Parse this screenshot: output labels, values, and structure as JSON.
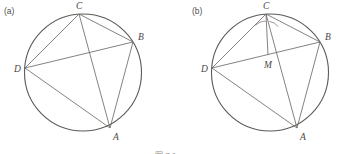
{
  "figure": {
    "caption": "图 7.1",
    "panels": [
      {
        "id": "a",
        "label": "(a)",
        "circle": {
          "cx": 83,
          "cy": 72.5,
          "r": 58.5
        },
        "points": [
          {
            "name": "A",
            "label": "A",
            "x": 110,
            "y": 128,
            "lx": 113,
            "ly": 140
          },
          {
            "name": "B",
            "label": "B",
            "x": 133,
            "y": 42,
            "lx": 138,
            "ly": 40
          },
          {
            "name": "C",
            "label": "C",
            "x": 79,
            "y": 14,
            "lx": 76,
            "ly": 9
          },
          {
            "name": "D",
            "label": "D",
            "x": 25,
            "y": 68,
            "lx": 14,
            "ly": 72
          }
        ],
        "segments": [
          {
            "from": "D",
            "to": "C"
          },
          {
            "from": "C",
            "to": "B"
          },
          {
            "from": "B",
            "to": "A"
          },
          {
            "from": "A",
            "to": "D"
          },
          {
            "from": "D",
            "to": "B"
          },
          {
            "from": "C",
            "to": "A"
          }
        ]
      },
      {
        "id": "b",
        "label": "(b)",
        "circle": {
          "cx": 270,
          "cy": 72.5,
          "r": 58.5
        },
        "points": [
          {
            "name": "A",
            "label": "A",
            "x": 297,
            "y": 128,
            "lx": 300,
            "ly": 140
          },
          {
            "name": "B",
            "label": "B",
            "x": 320,
            "y": 42,
            "lx": 325,
            "ly": 40
          },
          {
            "name": "C",
            "label": "C",
            "x": 266,
            "y": 14,
            "lx": 263,
            "ly": 9
          },
          {
            "name": "D",
            "label": "D",
            "x": 212,
            "y": 68,
            "lx": 201,
            "ly": 72
          },
          {
            "name": "M",
            "label": "M",
            "x": 268,
            "y": 55,
            "lx": 265,
            "ly": 68
          }
        ],
        "segments": [
          {
            "from": "D",
            "to": "C"
          },
          {
            "from": "C",
            "to": "B"
          },
          {
            "from": "B",
            "to": "A"
          },
          {
            "from": "A",
            "to": "D"
          },
          {
            "from": "D",
            "to": "B"
          },
          {
            "from": "C",
            "to": "A"
          },
          {
            "from": "C",
            "to": "M"
          }
        ],
        "angle_marks": [
          {
            "at": "C",
            "name": "angle-arc-dcm",
            "d": "M 255.5 25.5 A 13 13 0 0 1 265.6 21.2"
          },
          {
            "at": "C",
            "name": "angle-arc-mca",
            "d": "M 269.2 21.4 A 13 13 0 0 1 278.2 26.6"
          }
        ]
      }
    ],
    "colors": {
      "stroke": "#6f6c69",
      "circle_stroke": "#5d5a57",
      "label_fill": "#4a4744",
      "panel_label_fill": "#55514e",
      "background": "#ffffff"
    }
  }
}
